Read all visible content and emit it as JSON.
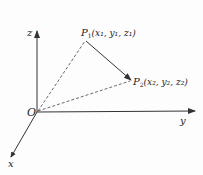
{
  "diagram": {
    "type": "3d-coordinate-vector",
    "origin": {
      "label": "O"
    },
    "axes": [
      {
        "name": "z",
        "label": "z"
      },
      {
        "name": "y",
        "label": "y"
      },
      {
        "name": "x",
        "label": "x"
      }
    ],
    "points": [
      {
        "id": "P1",
        "name": "P",
        "sub": "1",
        "coords": "(x₁, y₁, z₁)"
      },
      {
        "id": "P2",
        "name": "P",
        "sub": "2",
        "coords": "(x₂, y₂, z₂)"
      }
    ],
    "edges": [
      {
        "from": "O",
        "to": "P1",
        "style": "dashed"
      },
      {
        "from": "O",
        "to": "P2",
        "style": "dashed"
      },
      {
        "from": "P1",
        "to": "P2",
        "style": "solid-arrow"
      }
    ],
    "colors": {
      "stroke": "#333333",
      "background": "#fdfdfd"
    }
  }
}
